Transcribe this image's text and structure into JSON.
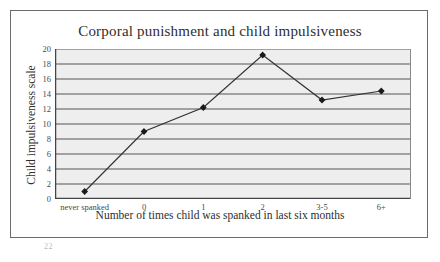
{
  "figure": {
    "title": "Corporal punishment and child impulsiveness",
    "scan_artifact": "22"
  },
  "chart_data": {
    "type": "line",
    "title": "Corporal punishment and child impulsiveness",
    "xlabel": "Number of times child was spanked in last six months",
    "ylabel": "Child impulsiveness scale",
    "categories": [
      "never spanked",
      "0",
      "1",
      "2",
      "3-5",
      "6+"
    ],
    "values": [
      1.0,
      9.0,
      12.2,
      19.2,
      13.2,
      14.4
    ],
    "ylim": [
      0,
      20
    ],
    "ytick_labels": [
      "0",
      "2",
      "4",
      "6",
      "8",
      "10",
      "12",
      "14",
      "16",
      "18",
      "20"
    ],
    "ytick_values": [
      0,
      2,
      4,
      6,
      8,
      10,
      12,
      14,
      16,
      18,
      20
    ],
    "grid": "horizontal",
    "legend": "none",
    "marker": "filled-diamond",
    "line_color": "#333333",
    "marker_color": "#1a1a1a",
    "plot_background": "#eeeeee",
    "gridline_color": "#555555"
  }
}
